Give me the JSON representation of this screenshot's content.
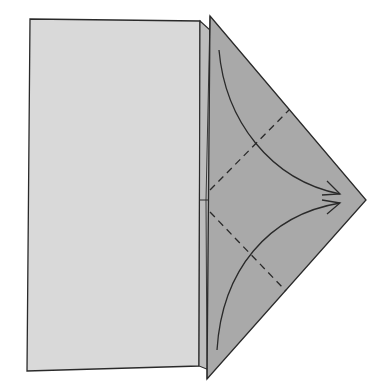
{
  "diagram": {
    "type": "origami-fold-step",
    "colors": {
      "background": "#ffffff",
      "rectangle_fill": "#d9d9d9",
      "flap_fill": "#a9a9a9",
      "strip_fill": "#bdbdbd",
      "line": "#2a2a2a"
    },
    "elements": {
      "rectangle": {
        "label": ""
      },
      "flap": {
        "label": ""
      },
      "fold_lines": [
        {
          "id": "upper-valley-fold",
          "style": "dashed"
        },
        {
          "id": "lower-valley-fold",
          "style": "dashed"
        }
      ],
      "arrows": [
        {
          "id": "upper-fold-arrow",
          "direction": "to-tip"
        },
        {
          "id": "lower-fold-arrow",
          "direction": "to-tip"
        }
      ]
    }
  }
}
